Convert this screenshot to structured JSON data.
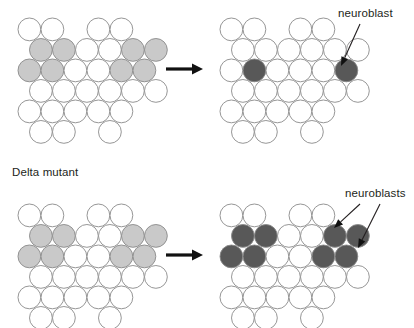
{
  "figure": {
    "width": 414,
    "height": 328,
    "background": "#ffffff",
    "cell_radius": 11.4,
    "colors": {
      "outline": "#8a8a8a",
      "white_cell": "#ffffff",
      "light_gray_cell": "#c9c9c9",
      "dark_gray_cell": "#585858",
      "arrow": "#111111",
      "text": "#231f20"
    }
  },
  "labels": [
    {
      "name": "delta-mutant-label",
      "text": "Delta mutant",
      "x": 12,
      "y": 166
    },
    {
      "name": "neuroblast-label",
      "text": "neuroblast",
      "x": 338,
      "y": 7
    },
    {
      "name": "neuroblasts-label",
      "text": "neuroblasts",
      "x": 345,
      "y": 187
    }
  ],
  "arrows": [
    {
      "name": "transition-arrow-top",
      "x1": 166,
      "y1": 69,
      "x2": 203,
      "y2": 69
    },
    {
      "name": "transition-arrow-bottom",
      "x1": 166,
      "y1": 255,
      "x2": 203,
      "y2": 255
    }
  ],
  "leaders": [
    {
      "name": "neuroblast-leader-top",
      "x1": 360,
      "y1": 24,
      "x2": 341,
      "y2": 66
    },
    {
      "name": "neuroblasts-leader-left",
      "x1": 360,
      "y1": 204,
      "x2": 334,
      "y2": 228
    },
    {
      "name": "neuroblasts-leader-right",
      "x1": 380,
      "y1": 204,
      "x2": 358,
      "y2": 248
    }
  ],
  "panels": [
    {
      "name": "panel-wildtype-before",
      "origin_x": 18,
      "origin_y": 18,
      "rows": [
        {
          "y": 0,
          "cells": [
            {
              "x": 0,
              "fill": "white"
            },
            {
              "x": 23,
              "fill": "white"
            },
            {
              "x": 69,
              "fill": "white"
            },
            {
              "x": 92,
              "fill": "white"
            }
          ]
        },
        {
          "y": 20.5,
          "cells": [
            {
              "x": 11.5,
              "fill": "light"
            },
            {
              "x": 34.5,
              "fill": "light"
            },
            {
              "x": 57.5,
              "fill": "white"
            },
            {
              "x": 80.5,
              "fill": "white"
            },
            {
              "x": 103.5,
              "fill": "light"
            },
            {
              "x": 126.5,
              "fill": "light"
            }
          ]
        },
        {
          "y": 41,
          "cells": [
            {
              "x": 0,
              "fill": "light"
            },
            {
              "x": 23,
              "fill": "light"
            },
            {
              "x": 46,
              "fill": "white"
            },
            {
              "x": 69,
              "fill": "white"
            },
            {
              "x": 92,
              "fill": "light"
            },
            {
              "x": 115,
              "fill": "light"
            }
          ]
        },
        {
          "y": 61.5,
          "cells": [
            {
              "x": 11.5,
              "fill": "white"
            },
            {
              "x": 34.5,
              "fill": "white"
            },
            {
              "x": 57.5,
              "fill": "white"
            },
            {
              "x": 80.5,
              "fill": "white"
            },
            {
              "x": 103.5,
              "fill": "white"
            },
            {
              "x": 126.5,
              "fill": "white"
            }
          ]
        },
        {
          "y": 82,
          "cells": [
            {
              "x": 0,
              "fill": "white"
            },
            {
              "x": 23,
              "fill": "white"
            },
            {
              "x": 46,
              "fill": "white"
            },
            {
              "x": 69,
              "fill": "white"
            },
            {
              "x": 92,
              "fill": "white"
            }
          ]
        },
        {
          "y": 102.5,
          "cells": [
            {
              "x": 11.5,
              "fill": "white"
            },
            {
              "x": 34.5,
              "fill": "white"
            },
            {
              "x": 80.5,
              "fill": "white"
            }
          ]
        }
      ]
    },
    {
      "name": "panel-wildtype-after",
      "origin_x": 220,
      "origin_y": 18,
      "rows": [
        {
          "y": 0,
          "cells": [
            {
              "x": 0,
              "fill": "white"
            },
            {
              "x": 23,
              "fill": "white"
            },
            {
              "x": 69,
              "fill": "white"
            },
            {
              "x": 92,
              "fill": "white"
            }
          ]
        },
        {
          "y": 20.5,
          "cells": [
            {
              "x": 11.5,
              "fill": "white"
            },
            {
              "x": 34.5,
              "fill": "white"
            },
            {
              "x": 57.5,
              "fill": "white"
            },
            {
              "x": 80.5,
              "fill": "white"
            },
            {
              "x": 103.5,
              "fill": "white"
            },
            {
              "x": 126.5,
              "fill": "white"
            }
          ]
        },
        {
          "y": 41,
          "cells": [
            {
              "x": 0,
              "fill": "white"
            },
            {
              "x": 23,
              "fill": "dark"
            },
            {
              "x": 46,
              "fill": "white"
            },
            {
              "x": 69,
              "fill": "white"
            },
            {
              "x": 92,
              "fill": "white"
            },
            {
              "x": 115,
              "fill": "dark"
            }
          ]
        },
        {
          "y": 61.5,
          "cells": [
            {
              "x": 11.5,
              "fill": "white"
            },
            {
              "x": 34.5,
              "fill": "white"
            },
            {
              "x": 57.5,
              "fill": "white"
            },
            {
              "x": 80.5,
              "fill": "white"
            },
            {
              "x": 103.5,
              "fill": "white"
            },
            {
              "x": 126.5,
              "fill": "white"
            }
          ]
        },
        {
          "y": 82,
          "cells": [
            {
              "x": 0,
              "fill": "white"
            },
            {
              "x": 23,
              "fill": "white"
            },
            {
              "x": 46,
              "fill": "white"
            },
            {
              "x": 69,
              "fill": "white"
            },
            {
              "x": 92,
              "fill": "white"
            }
          ]
        },
        {
          "y": 102.5,
          "cells": [
            {
              "x": 11.5,
              "fill": "white"
            },
            {
              "x": 34.5,
              "fill": "white"
            },
            {
              "x": 80.5,
              "fill": "white"
            }
          ]
        }
      ]
    },
    {
      "name": "panel-delta-before",
      "origin_x": 18,
      "origin_y": 204,
      "rows": [
        {
          "y": 0,
          "cells": [
            {
              "x": 0,
              "fill": "white"
            },
            {
              "x": 23,
              "fill": "white"
            },
            {
              "x": 69,
              "fill": "white"
            },
            {
              "x": 92,
              "fill": "white"
            }
          ]
        },
        {
          "y": 20.5,
          "cells": [
            {
              "x": 11.5,
              "fill": "light"
            },
            {
              "x": 34.5,
              "fill": "light"
            },
            {
              "x": 57.5,
              "fill": "white"
            },
            {
              "x": 80.5,
              "fill": "white"
            },
            {
              "x": 103.5,
              "fill": "light"
            },
            {
              "x": 126.5,
              "fill": "light"
            }
          ]
        },
        {
          "y": 41,
          "cells": [
            {
              "x": 0,
              "fill": "light"
            },
            {
              "x": 23,
              "fill": "light"
            },
            {
              "x": 46,
              "fill": "white"
            },
            {
              "x": 69,
              "fill": "white"
            },
            {
              "x": 92,
              "fill": "light"
            },
            {
              "x": 115,
              "fill": "light"
            }
          ]
        },
        {
          "y": 61.5,
          "cells": [
            {
              "x": 11.5,
              "fill": "white"
            },
            {
              "x": 34.5,
              "fill": "white"
            },
            {
              "x": 57.5,
              "fill": "white"
            },
            {
              "x": 80.5,
              "fill": "white"
            },
            {
              "x": 103.5,
              "fill": "white"
            },
            {
              "x": 126.5,
              "fill": "white"
            }
          ]
        },
        {
          "y": 82,
          "cells": [
            {
              "x": 0,
              "fill": "white"
            },
            {
              "x": 23,
              "fill": "white"
            },
            {
              "x": 46,
              "fill": "white"
            },
            {
              "x": 69,
              "fill": "white"
            },
            {
              "x": 92,
              "fill": "white"
            }
          ]
        },
        {
          "y": 102.5,
          "cells": [
            {
              "x": 11.5,
              "fill": "white"
            },
            {
              "x": 34.5,
              "fill": "white"
            },
            {
              "x": 80.5,
              "fill": "white"
            }
          ]
        }
      ]
    },
    {
      "name": "panel-delta-after",
      "origin_x": 220,
      "origin_y": 204,
      "rows": [
        {
          "y": 0,
          "cells": [
            {
              "x": 0,
              "fill": "white"
            },
            {
              "x": 23,
              "fill": "white"
            },
            {
              "x": 69,
              "fill": "white"
            },
            {
              "x": 92,
              "fill": "white"
            }
          ]
        },
        {
          "y": 20.5,
          "cells": [
            {
              "x": 11.5,
              "fill": "dark"
            },
            {
              "x": 34.5,
              "fill": "dark"
            },
            {
              "x": 57.5,
              "fill": "white"
            },
            {
              "x": 80.5,
              "fill": "white"
            },
            {
              "x": 103.5,
              "fill": "dark"
            },
            {
              "x": 126.5,
              "fill": "dark"
            }
          ]
        },
        {
          "y": 41,
          "cells": [
            {
              "x": 0,
              "fill": "dark"
            },
            {
              "x": 23,
              "fill": "dark"
            },
            {
              "x": 46,
              "fill": "white"
            },
            {
              "x": 69,
              "fill": "white"
            },
            {
              "x": 92,
              "fill": "dark"
            },
            {
              "x": 115,
              "fill": "dark"
            }
          ]
        },
        {
          "y": 61.5,
          "cells": [
            {
              "x": 11.5,
              "fill": "white"
            },
            {
              "x": 34.5,
              "fill": "white"
            },
            {
              "x": 57.5,
              "fill": "white"
            },
            {
              "x": 80.5,
              "fill": "white"
            },
            {
              "x": 103.5,
              "fill": "white"
            },
            {
              "x": 126.5,
              "fill": "white"
            }
          ]
        },
        {
          "y": 82,
          "cells": [
            {
              "x": 0,
              "fill": "white"
            },
            {
              "x": 23,
              "fill": "white"
            },
            {
              "x": 46,
              "fill": "white"
            },
            {
              "x": 69,
              "fill": "white"
            },
            {
              "x": 92,
              "fill": "white"
            }
          ]
        },
        {
          "y": 102.5,
          "cells": [
            {
              "x": 11.5,
              "fill": "white"
            },
            {
              "x": 34.5,
              "fill": "white"
            },
            {
              "x": 80.5,
              "fill": "white"
            }
          ]
        }
      ]
    }
  ]
}
